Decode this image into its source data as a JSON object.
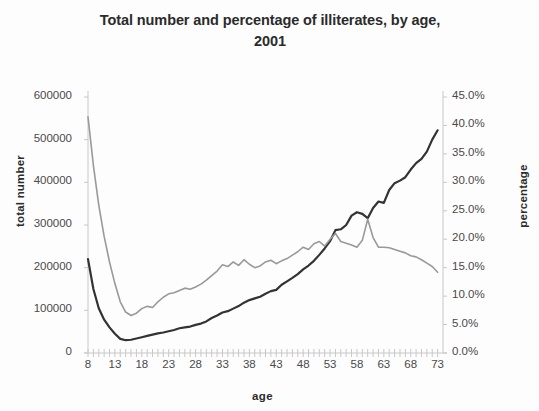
{
  "chart_data": {
    "type": "line",
    "title": "Total number and percentage of illiterates, by age, 2001",
    "title_line1": "Total number and percentage of illiterates, by age,",
    "title_line2": "2001",
    "xlabel": "age",
    "ylabel": "total number",
    "ylabel_right": "percentage",
    "xlim": [
      8,
      74
    ],
    "ylim": [
      0,
      600000
    ],
    "ylim_right": [
      0,
      0.45
    ],
    "grid": false,
    "legend": "none",
    "y_tick_labels": [
      "600000",
      "500000",
      "400000",
      "300000",
      "200000",
      "100000",
      "0"
    ],
    "y_tick_values": [
      600000,
      500000,
      400000,
      300000,
      200000,
      100000,
      0
    ],
    "y2_tick_labels": [
      "45.0%",
      "40.0%",
      "35.0%",
      "30.0%",
      "25.0%",
      "20.0%",
      "15.0%",
      "10.0%",
      "5.0%",
      "0.0%"
    ],
    "y2_tick_values": [
      45,
      40,
      35,
      30,
      25,
      20,
      15,
      10,
      5,
      0
    ],
    "x_tick_labels": [
      "8",
      "13",
      "18",
      "23",
      "28",
      "33",
      "38",
      "43",
      "48",
      "53",
      "58",
      "63",
      "68",
      "73"
    ],
    "x_tick_values": [
      8,
      13,
      18,
      23,
      28,
      33,
      38,
      43,
      48,
      53,
      58,
      63,
      68,
      73
    ],
    "x": [
      8,
      9,
      10,
      11,
      12,
      13,
      14,
      15,
      16,
      17,
      18,
      19,
      20,
      21,
      22,
      23,
      24,
      25,
      26,
      27,
      28,
      29,
      30,
      31,
      32,
      33,
      34,
      35,
      36,
      37,
      38,
      39,
      40,
      41,
      42,
      43,
      44,
      45,
      46,
      47,
      48,
      49,
      50,
      51,
      52,
      53,
      54,
      55,
      56,
      57,
      58,
      59,
      60,
      61,
      62,
      63,
      64,
      65,
      66,
      67,
      68,
      69,
      70,
      71,
      72,
      73
    ],
    "colors": {
      "total_number_line": "#333333",
      "percentage_line": "#999999",
      "axis": "#c8c8c8",
      "text": "#4a4a4a"
    },
    "series": [
      {
        "name": "total number",
        "axis": "left",
        "color": "#333333",
        "values": [
          220000,
          150000,
          105000,
          78000,
          60000,
          45000,
          33000,
          30000,
          31000,
          34000,
          37000,
          40000,
          43000,
          46000,
          48000,
          51000,
          54000,
          58000,
          60000,
          62000,
          66000,
          69000,
          74000,
          82000,
          88000,
          95000,
          98000,
          104000,
          110000,
          118000,
          124000,
          128000,
          132000,
          139000,
          145000,
          148000,
          160000,
          168000,
          176000,
          185000,
          196000,
          205000,
          216000,
          230000,
          245000,
          262000,
          288000,
          290000,
          300000,
          322000,
          330000,
          326000,
          316000,
          340000,
          355000,
          352000,
          382000,
          398000,
          404000,
          412000,
          430000,
          445000,
          455000,
          472000,
          500000,
          522000
        ]
      },
      {
        "name": "percentage",
        "axis": "right",
        "color": "#999999",
        "values": [
          41.5,
          33.0,
          26.0,
          20.5,
          16.0,
          12.2,
          9.0,
          7.2,
          6.6,
          7.0,
          7.8,
          8.2,
          8.0,
          9.0,
          9.8,
          10.4,
          10.6,
          11.0,
          11.4,
          11.2,
          11.6,
          12.1,
          12.8,
          13.6,
          14.4,
          15.5,
          15.2,
          16.0,
          15.4,
          16.4,
          15.6,
          15.0,
          15.3,
          16.0,
          16.3,
          15.7,
          16.2,
          16.6,
          17.2,
          17.8,
          18.6,
          18.2,
          19.2,
          19.6,
          18.8,
          20.0,
          21.0,
          19.6,
          19.3,
          19.0,
          18.6,
          19.8,
          23.5,
          20.3,
          18.6,
          18.6,
          18.5,
          18.2,
          17.9,
          17.6,
          17.1,
          16.9,
          16.4,
          15.8,
          15.2,
          14.2
        ]
      }
    ]
  }
}
